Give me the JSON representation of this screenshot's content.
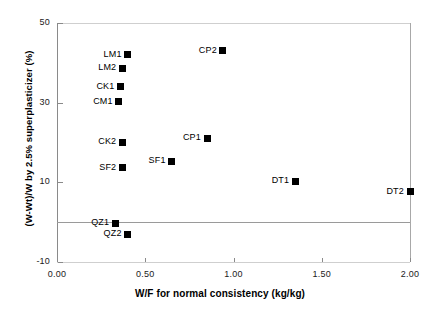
{
  "chart_data": {
    "type": "scatter",
    "title": "",
    "xlabel": "W/F for normal consistency (kg/kg)",
    "ylabel": "(W-Wt)/W by 2.5% superplasticizer (%)",
    "xlim": [
      0.0,
      2.0
    ],
    "ylim": [
      -10,
      50
    ],
    "xticks": [
      "0.00",
      "0.50",
      "1.00",
      "1.50",
      "2.00"
    ],
    "xtick_values": [
      0.0,
      0.5,
      1.0,
      1.5,
      2.0
    ],
    "yticks": [
      "50",
      "30",
      "10",
      "-10"
    ],
    "ytick_values": [
      50,
      30,
      10,
      -10
    ],
    "grid": false,
    "legend": "none",
    "marker": "filled-square",
    "marker_color": "#000000",
    "points": [
      {
        "label": "LM1",
        "x": 0.4,
        "y": 42.0
      },
      {
        "label": "CP2",
        "x": 0.94,
        "y": 43.0
      },
      {
        "label": "LM2",
        "x": 0.37,
        "y": 38.7
      },
      {
        "label": "CK1",
        "x": 0.36,
        "y": 34.0
      },
      {
        "label": "CM1",
        "x": 0.35,
        "y": 30.2
      },
      {
        "label": "CK2",
        "x": 0.37,
        "y": 20.1
      },
      {
        "label": "CP1",
        "x": 0.85,
        "y": 21.1
      },
      {
        "label": "SF1",
        "x": 0.65,
        "y": 15.3
      },
      {
        "label": "SF2",
        "x": 0.37,
        "y": 13.6
      },
      {
        "label": "DT1",
        "x": 1.35,
        "y": 10.3
      },
      {
        "label": "DT2",
        "x": 2.0,
        "y": 7.6
      },
      {
        "label": "QZ1",
        "x": 0.33,
        "y": -0.3
      },
      {
        "label": "QZ2",
        "x": 0.4,
        "y": -3.0
      }
    ]
  }
}
